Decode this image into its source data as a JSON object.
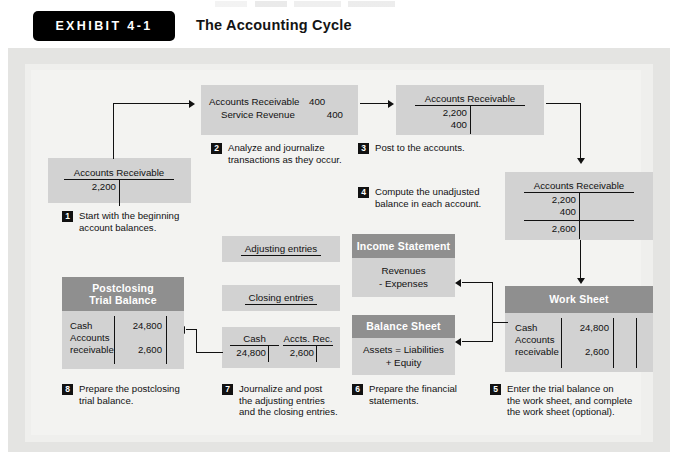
{
  "exhibit": {
    "tag": "EXHIBIT 4-1",
    "title": "The Accounting Cycle"
  },
  "steps": [
    {
      "number": "1",
      "caption": "Start with the beginning\naccount balances."
    },
    {
      "number": "2",
      "caption": "Analyze and journalize\ntransactions as they occur."
    },
    {
      "number": "3",
      "caption": "Post to the accounts."
    },
    {
      "number": "4",
      "caption": "Compute the unadjusted\nbalance in each account."
    },
    {
      "number": "5",
      "caption": "Enter the trial balance on\nthe work sheet, and complete\nthe work sheet (optional)."
    },
    {
      "number": "6",
      "caption": "Prepare the financial\nstatements."
    },
    {
      "number": "7",
      "caption": "Journalize and post\nthe adjusting entries\nand the closing entries."
    },
    {
      "number": "8",
      "caption": "Prepare the postclosing\ntrial balance."
    }
  ],
  "beginning_balance_account": {
    "title": "Accounts Receivable",
    "debits": [
      "2,200"
    ]
  },
  "journal_entry": {
    "debit_account": "Accounts Receivable",
    "debit_amount": "400",
    "credit_account": "Service Revenue",
    "credit_amount": "400"
  },
  "posted_account": {
    "title": "Accounts Receivable",
    "debits": [
      "2,200",
      "400"
    ]
  },
  "unadjusted_balance_account": {
    "title": "Accounts Receivable",
    "debits": [
      "2,200",
      "400"
    ],
    "balance": "2,600"
  },
  "work_sheet": {
    "header": "Work Sheet",
    "rows": [
      {
        "name": "Cash",
        "amount": "24,800"
      },
      {
        "name": "Accounts\n  receivable",
        "amount": "2,600"
      }
    ]
  },
  "postclosing_trial_balance": {
    "header": "Postclosing\nTrial Balance",
    "rows": [
      {
        "name": "Cash",
        "amount": "24,800"
      },
      {
        "name": "Accounts\n  receivable",
        "amount": "2,600"
      }
    ]
  },
  "income_statement": {
    "header": "Income Statement",
    "body": "Revenues\n- Expenses"
  },
  "balance_sheet": {
    "header": "Balance Sheet",
    "body": "Assets = Liabilities\n+ Equity"
  },
  "adjusting_entries_label": "Adjusting entries",
  "closing_entries_label": "Closing entries",
  "closing_t_accounts": [
    {
      "title": "Cash",
      "amount": "24,800"
    },
    {
      "title": "Accts. Rec.",
      "amount": "2,600"
    }
  ]
}
